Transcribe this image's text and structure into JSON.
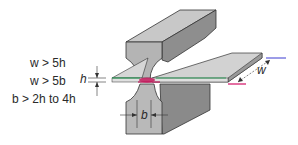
{
  "diagram": {
    "type": "resistance seam welding electrode geometry",
    "conditions": [
      {
        "lhs": "w",
        "op": ">",
        "rhs": "5h"
      },
      {
        "lhs": "w",
        "op": ">",
        "rhs": "5b"
      },
      {
        "lhs": "b",
        "op": ">",
        "rhs": "2h to 4h"
      }
    ],
    "condition_text": [
      "w > 5h",
      "w > 5b",
      "b > 2h to 4h"
    ],
    "labels": {
      "thickness": "h",
      "width": "w",
      "electrode_tip_width": "b"
    },
    "colors": {
      "electrode_fill": "#b9b9b9",
      "electrode_side": "#8c8c8c",
      "sheet_fill": "#d6d6d6",
      "top_edge_line": "#2e9b5a",
      "weld_zone": "#c2185b",
      "bottom_edge_line": "#d8317a",
      "dimension_line_top": "#3a3ad0",
      "text": "#2a2a2a"
    }
  }
}
